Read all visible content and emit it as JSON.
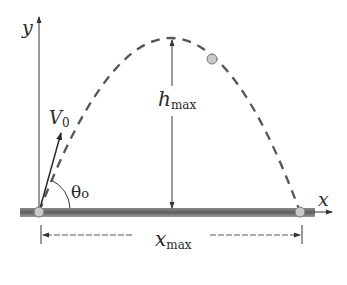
{
  "diagram": {
    "type": "projectile-motion",
    "labels": {
      "y_axis": "y",
      "x_axis": "x",
      "velocity": "V",
      "velocity_sub": "0",
      "angle": "θ",
      "angle_sub": "o",
      "h_max": "h",
      "h_max_sub": "max",
      "x_max": "x",
      "x_max_sub": "max"
    },
    "colors": {
      "ink": "#2a2a2a",
      "trajectory": "#555555",
      "ground": "#6e6e6e",
      "ball": "#c8c8c8"
    }
  }
}
